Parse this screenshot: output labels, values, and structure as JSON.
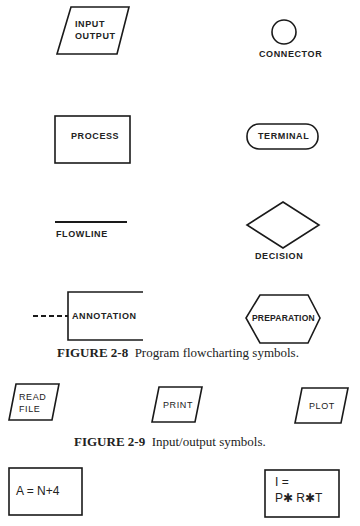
{
  "figure_2_8": {
    "caption_number": "FIGURE 2-8",
    "caption_text": "Program flowcharting symbols.",
    "symbols": {
      "input_output": {
        "line1": "INPUT",
        "line2": "OUTPUT"
      },
      "connector": "CONNECTOR",
      "process": "PROCESS",
      "terminal": "TERMINAL",
      "flowline": "FLOWLINE",
      "decision": "DECISION",
      "annotation": "ANNOTATION",
      "preparation": "PREPARATION"
    }
  },
  "figure_2_9": {
    "caption_number": "FIGURE 2-9",
    "caption_text": "Input/output symbols.",
    "symbols": {
      "read_file": {
        "line1": "READ",
        "line2": "FILE"
      },
      "print": "PRINT",
      "plot": "PLOT"
    }
  },
  "process_examples": {
    "left": "A = N+4",
    "right": {
      "line1": "I =",
      "line2": "P✱ R✱T"
    }
  },
  "colors": {
    "stroke": "#1a1a1a",
    "background": "#ffffff"
  }
}
